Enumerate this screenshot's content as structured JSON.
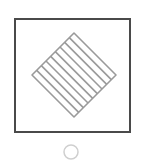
{
  "figure": {
    "outer_square": {
      "x": 15,
      "y": 19,
      "width": 115,
      "height": 113,
      "stroke": "#4a4a4a",
      "stroke_width": 2
    },
    "diamond": {
      "center": [
        74,
        75
      ],
      "half_diagonal": 42,
      "stroke": "#9a9a9a",
      "stroke_width": 1.6,
      "hatch_lines": 8,
      "hatch_direction": "parallel to top-right edge"
    },
    "option_circle": {
      "cx": 71,
      "cy": 152,
      "r": 7,
      "stroke": "#cfcfcf",
      "stroke_width": 1.5,
      "selected": false
    }
  }
}
